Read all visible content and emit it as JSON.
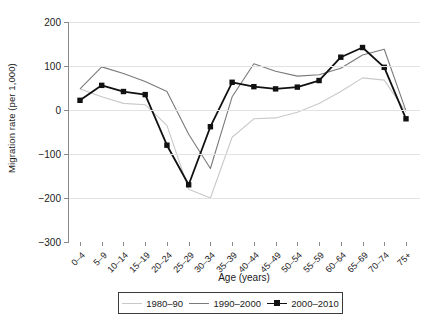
{
  "chart_data": {
    "type": "line",
    "title": "",
    "xlabel": "Age (years)",
    "ylabel": "Migration rate (per 1,000)",
    "categories": [
      "0–4",
      "5–9",
      "10–14",
      "15–19",
      "20–24",
      "25–29",
      "30–34",
      "35–39",
      "40–44",
      "45–49",
      "50–54",
      "55–59",
      "60–64",
      "65–69",
      "70–74",
      "75+"
    ],
    "yticks": [
      200,
      100,
      0,
      -100,
      -200,
      -300
    ],
    "yticklabels": [
      "200",
      "100",
      "0",
      "−100",
      "−200",
      "−300"
    ],
    "ylim": [
      -300,
      200
    ],
    "grid": true,
    "legend_position": "bottom",
    "series": [
      {
        "name": "1980–90",
        "color": "#c9c9c9",
        "marker": "none",
        "values": [
          48,
          30,
          15,
          12,
          -35,
          -180,
          -200,
          -62,
          -20,
          -18,
          -5,
          15,
          42,
          73,
          68,
          -5
        ]
      },
      {
        "name": "1990–2000",
        "color": "#7a7a7a",
        "marker": "none",
        "values": [
          48,
          98,
          83,
          65,
          42,
          -55,
          -133,
          30,
          105,
          88,
          77,
          80,
          95,
          125,
          138,
          -2
        ]
      },
      {
        "name": "2000–2010",
        "color": "#111111",
        "marker": "square",
        "values": [
          22,
          56,
          42,
          35,
          -80,
          -170,
          -38,
          63,
          53,
          48,
          52,
          67,
          120,
          142,
          97,
          -20
        ]
      }
    ]
  }
}
